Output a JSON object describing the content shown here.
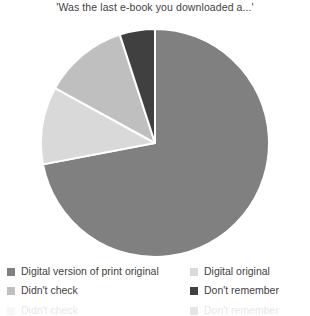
{
  "chart_data": {
    "type": "pie",
    "title": "'Was the last e-book you downloaded a...'",
    "categories": [
      "Digital version of print original",
      "Digital original",
      "Didn't check",
      "Don't remember"
    ],
    "values": [
      72,
      11,
      12,
      5
    ],
    "colors": [
      "#808080",
      "#d9d9d9",
      "#bfbfbf",
      "#404040"
    ],
    "legend_position": "bottom",
    "grid": false,
    "xlabel": "",
    "ylabel": "",
    "slice_border_color": "#ffffff"
  },
  "legend": {
    "items": [
      {
        "label": "Digital version of print original",
        "color": "#808080"
      },
      {
        "label": "Digital original",
        "color": "#d9d9d9"
      },
      {
        "label": "Didn't check",
        "color": "#bfbfbf"
      },
      {
        "label": "Don't remember",
        "color": "#404040"
      }
    ]
  }
}
